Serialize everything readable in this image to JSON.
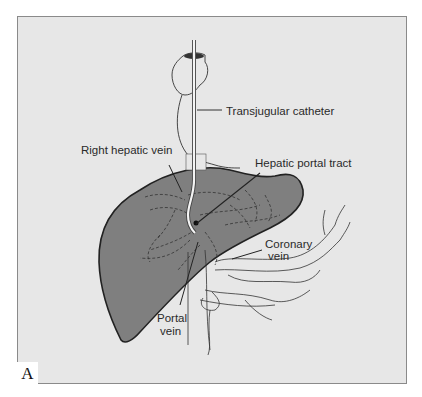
{
  "figure": {
    "panel_letter": "A",
    "background_color": "#e7e7e7",
    "liver_color": "#7f7f7f",
    "labels": {
      "transjugular_catheter": "Transjugular catheter",
      "right_hepatic_vein": "Right hepatic vein",
      "hepatic_portal_tract": "Hepatic portal tract",
      "coronary_vein_line1": "Coronary",
      "coronary_vein_line2": "vein",
      "portal_vein_line1": "Portal",
      "portal_vein_line2": "vein"
    }
  }
}
